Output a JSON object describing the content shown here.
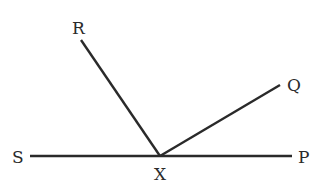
{
  "diagram": {
    "type": "geometry-angles",
    "points": {
      "S": {
        "label": "S",
        "x": 30,
        "y": 156
      },
      "P": {
        "label": "P",
        "x": 292,
        "y": 156
      },
      "X": {
        "label": "X",
        "x": 160,
        "y": 156
      },
      "R": {
        "label": "R",
        "x": 81,
        "y": 40
      },
      "Q": {
        "label": "Q",
        "x": 280,
        "y": 85
      }
    },
    "segments": [
      {
        "name": "SP",
        "from": "S",
        "to": "P"
      },
      {
        "name": "XR",
        "from": "X",
        "to": "R"
      },
      {
        "name": "XQ",
        "from": "X",
        "to": "Q"
      }
    ],
    "labels": {
      "R": "R",
      "Q": "Q",
      "S": "S",
      "P": "P",
      "X": "X"
    },
    "line_color": "#2a2a2a"
  }
}
